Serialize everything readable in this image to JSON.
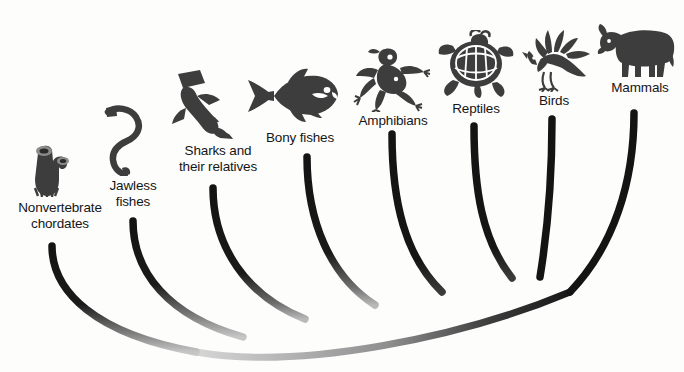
{
  "figure": {
    "kind": "phylogenetic-tree",
    "background_color": "#fdfdfc",
    "branch_color_tip": "#141414",
    "branch_color_root": "#c9c9c9",
    "silhouette_color": "#3d3d3d",
    "label_color": "#161616"
  },
  "taxa": [
    {
      "id": "nonvertebrate-chordates",
      "label": "Nonvertebrate\nchordates",
      "icon": "tunicate-icon",
      "label_x": 8,
      "label_y": 200,
      "label_w": 104,
      "icon_x": 26,
      "icon_y": 139,
      "icon_w": 46,
      "icon_h": 58,
      "tip_x": 52,
      "tip_y": 246
    },
    {
      "id": "jawless-fishes",
      "label": "Jawless\nfishes",
      "icon": "lamprey-icon",
      "label_x": 98,
      "label_y": 178,
      "label_w": 70,
      "icon_x": 100,
      "icon_y": 104,
      "icon_w": 60,
      "icon_h": 72,
      "tip_x": 133,
      "tip_y": 221
    },
    {
      "id": "sharks-and-relatives",
      "label": "Sharks and\ntheir relatives",
      "icon": "hammerhead-shark-icon",
      "label_x": 168,
      "label_y": 143,
      "label_w": 100,
      "icon_x": 164,
      "icon_y": 70,
      "icon_w": 80,
      "icon_h": 72,
      "tip_x": 213,
      "tip_y": 188
    },
    {
      "id": "bony-fishes",
      "label": "Bony fishes",
      "icon": "tuna-icon",
      "label_x": 254,
      "label_y": 130,
      "label_w": 92,
      "icon_x": 244,
      "icon_y": 66,
      "icon_w": 96,
      "icon_h": 58,
      "tip_x": 307,
      "tip_y": 157
    },
    {
      "id": "amphibians",
      "label": "Amphibians",
      "icon": "frog-icon",
      "label_x": 348,
      "label_y": 113,
      "label_w": 90,
      "icon_x": 352,
      "icon_y": 46,
      "icon_w": 78,
      "icon_h": 66,
      "tip_x": 392,
      "tip_y": 134
    },
    {
      "id": "reptiles",
      "label": "Reptiles",
      "icon": "turtle-icon",
      "label_x": 440,
      "label_y": 101,
      "label_w": 72,
      "icon_x": 437,
      "icon_y": 30,
      "icon_w": 78,
      "icon_h": 68,
      "tip_x": 474,
      "tip_y": 126
    },
    {
      "id": "birds",
      "label": "Birds",
      "icon": "bird-icon",
      "label_x": 526,
      "label_y": 93,
      "label_w": 56,
      "icon_x": 520,
      "icon_y": 28,
      "icon_w": 76,
      "icon_h": 64,
      "tip_x": 552,
      "tip_y": 119
    },
    {
      "id": "mammals",
      "label": "Mammals",
      "icon": "cow-icon",
      "label_x": 600,
      "label_y": 80,
      "label_w": 80,
      "icon_x": 597,
      "icon_y": 19,
      "icon_w": 80,
      "icon_h": 60,
      "tip_x": 634,
      "tip_y": 113
    }
  ],
  "branches": [
    {
      "id": "branch-nonvertebrate-chordates",
      "taxon": "nonvertebrate-chordates",
      "path": "M 52 246 C 52 292 96 334 196 352"
    },
    {
      "id": "branch-jawless-fishes",
      "taxon": "jawless-fishes",
      "path": "M 133 221 C 133 272 168 316 243 337"
    },
    {
      "id": "branch-sharks-and-relatives",
      "taxon": "sharks-and-relatives",
      "path": "M 213 188 C 213 246 246 296 305 319"
    },
    {
      "id": "branch-bony-fishes",
      "taxon": "bony-fishes",
      "path": "M 307 157 C 307 221 330 276 375 305"
    },
    {
      "id": "branch-amphibians",
      "taxon": "amphibians",
      "path": "M 392 134 C 392 202 405 256 442 292"
    },
    {
      "id": "branch-reptiles",
      "taxon": "reptiles",
      "path": "M 474 126 C 474 190 482 240 512 278"
    },
    {
      "id": "branch-birds",
      "taxon": "birds",
      "path": "M 552 119 C 552 176 548 226 541 276"
    },
    {
      "id": "branch-mammals",
      "taxon": "mammals",
      "path": "M 634 113 C 634 182 614 246 570 292"
    },
    {
      "id": "branch-trunk",
      "taxon": "root",
      "path": "M 196 352 C 300 370 460 338 570 292"
    }
  ]
}
